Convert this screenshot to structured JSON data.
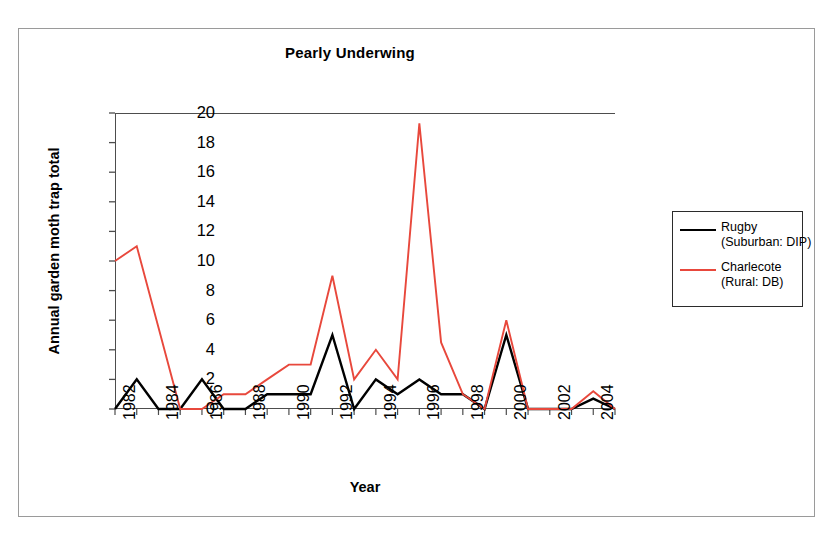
{
  "chart_data": {
    "type": "line",
    "title": "Pearly Underwing",
    "xlabel": "Year",
    "ylabel": "Annual garden moth trap total",
    "ylim": [
      0,
      20
    ],
    "ytick_labels": [
      "20",
      "18",
      "16",
      "14",
      "12",
      "10",
      "8",
      "6",
      "4",
      "2",
      "0"
    ],
    "yticks": [
      20,
      18,
      16,
      14,
      12,
      10,
      8,
      6,
      4,
      2,
      0
    ],
    "grid": false,
    "legend_position": "right-outside",
    "x": [
      1982,
      1983,
      1984,
      1985,
      1986,
      1987,
      1988,
      1989,
      1990,
      1991,
      1992,
      1993,
      1994,
      1995,
      1996,
      1997,
      1998,
      1999,
      2000,
      2001,
      2002,
      2003,
      2004,
      2005
    ],
    "xtick_labels": [
      "1982",
      "1984",
      "1986",
      "1988",
      "1990",
      "1992",
      "1994",
      "1996",
      "1998",
      "2000",
      "2002",
      "2004"
    ],
    "xtick_values": [
      1982,
      1984,
      1986,
      1988,
      1990,
      1992,
      1994,
      1996,
      1998,
      2000,
      2002,
      2004
    ],
    "xlim": [
      1982,
      2005
    ],
    "series": [
      {
        "name": "Rugby",
        "legend_label_line1": "Rugby",
        "legend_label_line2": "(Suburban: DIP)",
        "color": "#000000",
        "values": [
          0,
          2,
          0,
          0,
          2,
          0,
          0,
          1,
          1,
          1,
          5,
          0,
          2,
          1,
          2,
          1,
          1,
          0,
          5,
          0,
          0,
          0,
          0.7,
          0
        ]
      },
      {
        "name": "Charlecote",
        "legend_label_line1": "Charlecote",
        "legend_label_line2": "(Rural: DB)",
        "color": "#e8483c",
        "values": [
          10,
          11,
          5.5,
          0,
          0,
          1,
          1,
          2,
          3,
          3,
          9,
          2,
          4,
          2,
          19.3,
          4.5,
          1,
          0,
          6,
          0,
          0,
          0,
          1.2,
          0
        ]
      }
    ]
  },
  "legend": {
    "items": [
      {
        "label_line1": "Rugby",
        "label_line2": "(Suburban: DIP)",
        "color": "#000000"
      },
      {
        "label_line1": "Charlecote",
        "label_line2": "(Rural: DB)",
        "color": "#e8483c"
      }
    ]
  }
}
